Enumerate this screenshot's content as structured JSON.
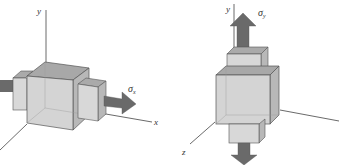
{
  "left_diagram": {
    "axis_y_label": "y",
    "axis_x_label": "x",
    "stress_label": "σ",
    "stress_subscript": "x",
    "description": "Cube element with uniaxial stress along x-axis"
  },
  "right_diagram": {
    "axis_y_label": "y",
    "axis_z_label": "z",
    "stress_label": "σ",
    "stress_subscript": "y",
    "description": "Cube element with uniaxial stress along y-axis"
  },
  "colors": {
    "cube_front": "#d4d4d4",
    "cube_top": "#a8a8a8",
    "cube_side": "#b8b8b8",
    "arrow": "#6a6a6a",
    "edge": "#555555",
    "axis": "#444444"
  }
}
